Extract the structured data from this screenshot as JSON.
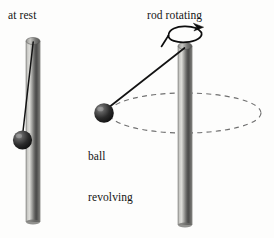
{
  "figure": {
    "background_color": "#fdfdfc",
    "width": 274,
    "height": 238
  },
  "labels": {
    "at_rest": "at rest",
    "rod_rotating": "rod rotating",
    "ball_revolving_line1": "ball",
    "ball_revolving_line2": "revolving"
  },
  "colors": {
    "rod_dark": "#3a3a3a",
    "rod_mid": "#8d8d8d",
    "rod_light": "#d9d9d6",
    "rod_outline": "#2e2e2e",
    "ball_dark": "#1a1a1a",
    "ball_mid": "#4a4a4a",
    "ball_highlight": "#9a9a9a",
    "string": "#111111",
    "orbit_dash": "#6f6f6f",
    "arrow": "#0d0d0d",
    "text": "#141414"
  },
  "left_scene": {
    "name": "rod-at-rest",
    "rod": {
      "x_left": 26,
      "x_right": 40,
      "y_top": 40,
      "y_bottom": 222,
      "cap_ry": 3.5
    },
    "string": {
      "x1": 33.5,
      "y1": 44,
      "x2": 22.5,
      "y2": 133
    },
    "ball": {
      "cx": 22.5,
      "cy": 140,
      "r": 9.5
    }
  },
  "right_scene": {
    "name": "rod-rotating",
    "rod": {
      "x_left": 178,
      "x_right": 192,
      "y_top": 45,
      "y_bottom": 225,
      "cap_ry": 3.5
    },
    "string": {
      "x1": 184,
      "y1": 49,
      "x2": 108,
      "y2": 108
    },
    "ball": {
      "cx": 104,
      "cy": 113,
      "r": 9.5
    },
    "orbit_ellipse": {
      "cx": 185,
      "cy": 113,
      "rx": 76,
      "ry": 20,
      "dash": "5,4"
    },
    "rotation_arrow": {
      "cx": 185,
      "cy": 38,
      "rx": 17,
      "ry": 7.5
    }
  }
}
